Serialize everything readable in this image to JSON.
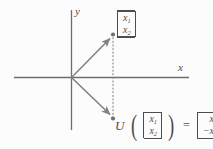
{
  "figure": {
    "name": "reflection-across-x-axis",
    "background_color": "#fcfcfc",
    "line_color": "#808080",
    "axis_color": "#6e6e6e",
    "text_color": "#4d4d4d"
  },
  "axes": {
    "x_label": "x",
    "y_label": "y"
  },
  "vectors": {
    "input": {
      "label_row1": "x",
      "label_sub1": "1",
      "label_row2": "x",
      "label_sub2": "2"
    },
    "output": {
      "label_row1": "x",
      "label_sub1": "1",
      "label_row2": "−x",
      "label_sub2": "2"
    }
  },
  "equation": {
    "function_name": "U",
    "open_paren": "(",
    "close_paren": ")",
    "equals": "=",
    "arg_row1": "x",
    "arg_sub1": "1",
    "arg_row2": "x",
    "arg_sub2": "2",
    "result_row1": "x",
    "result_sub1": "1",
    "result_row2": "−x",
    "result_sub2": "2"
  }
}
